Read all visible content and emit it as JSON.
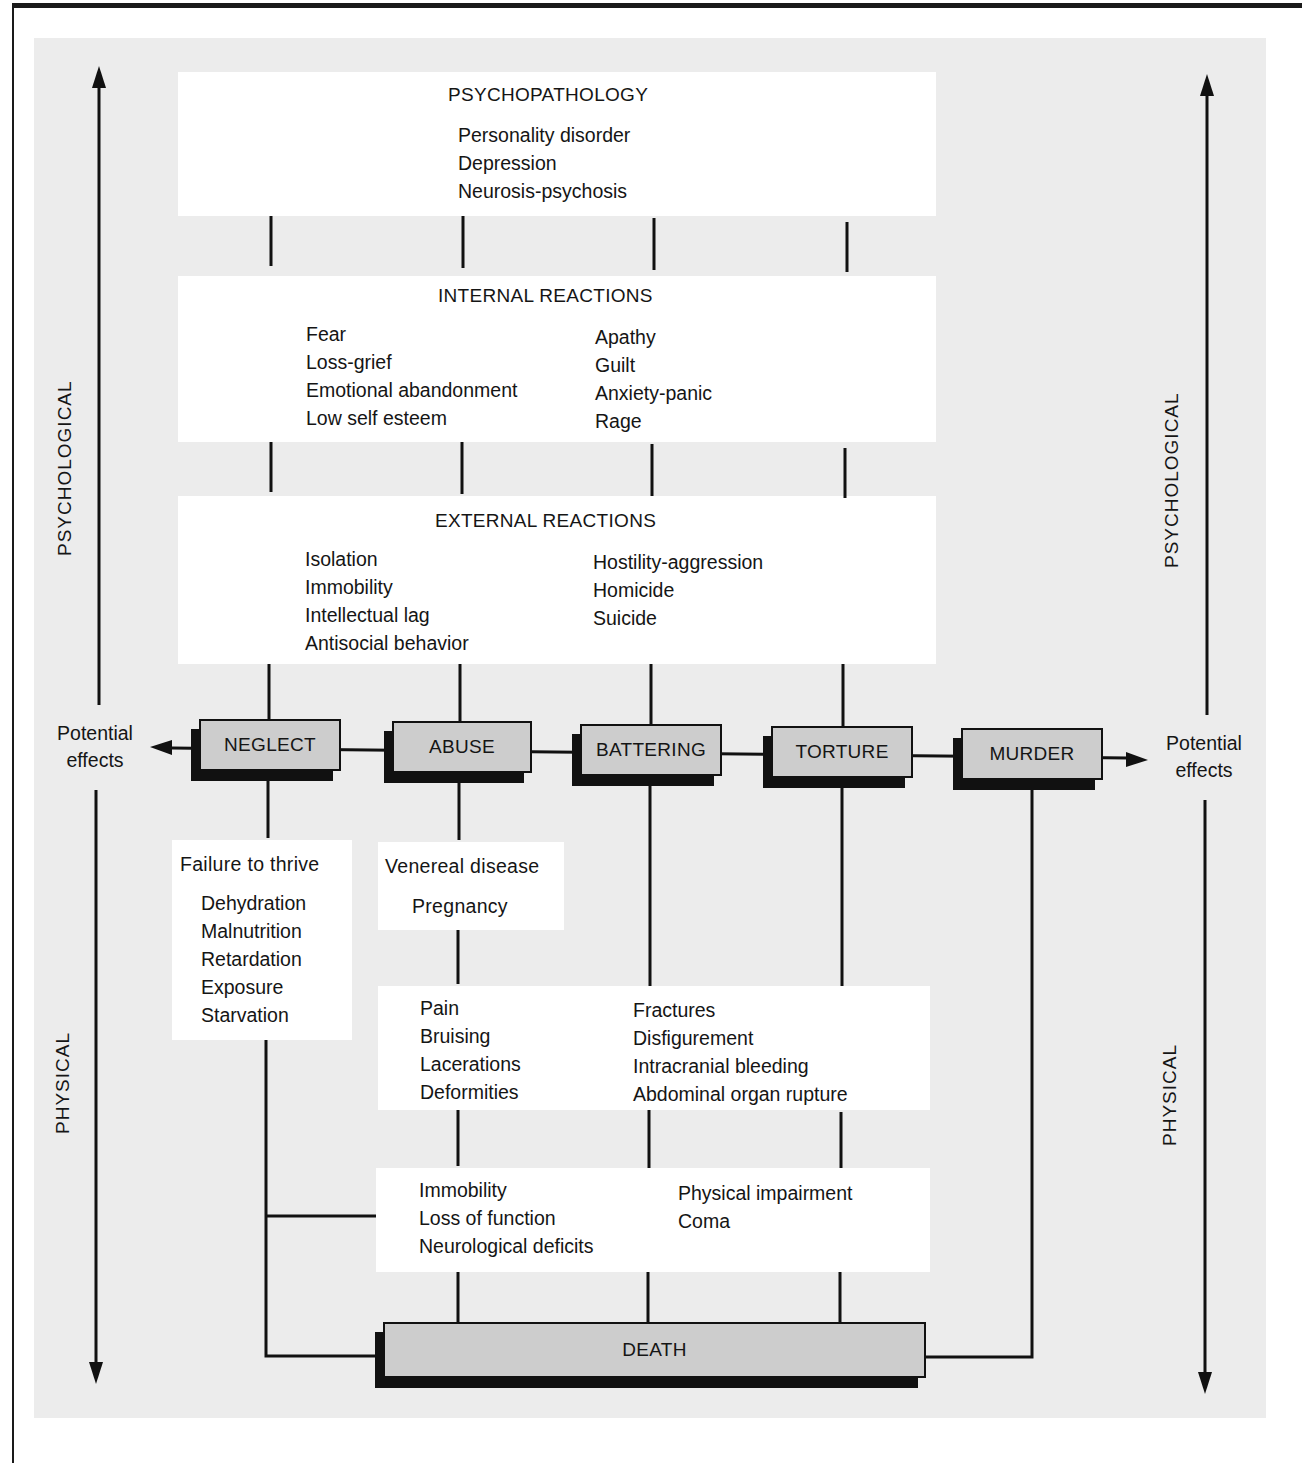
{
  "diagram": {
    "axis_labels": {
      "left_top": "PSYCHOLOGICAL",
      "left_bottom": "PHYSICAL",
      "right_top": "PSYCHOLOGICAL",
      "right_bottom": "PHYSICAL"
    },
    "potential_effects": {
      "left_line1": "Potential",
      "left_line2": "effects",
      "right_line1": "Potential",
      "right_line2": "effects"
    },
    "stages": [
      "NEGLECT",
      "ABUSE",
      "BATTERING",
      "TORTURE",
      "MURDER"
    ],
    "outcome": "DEATH",
    "psychopathology": {
      "title": "PSYCHOPATHOLOGY",
      "items": [
        "Personality disorder",
        "Depression",
        "Neurosis-psychosis"
      ]
    },
    "internal_reactions": {
      "title": "INTERNAL REACTIONS",
      "left": [
        "Fear",
        "Loss-grief",
        "Emotional abandonment",
        "Low self esteem"
      ],
      "right": [
        "Apathy",
        "Guilt",
        "Anxiety-panic",
        "Rage"
      ]
    },
    "external_reactions": {
      "title": "EXTERNAL REACTIONS",
      "left": [
        "Isolation",
        "Immobility",
        "Intellectual lag",
        "Antisocial behavior"
      ],
      "right": [
        "Hostility-aggression",
        "Homicide",
        "Suicide"
      ]
    },
    "neglect_effects": {
      "title": "Failure to thrive",
      "items": [
        "Dehydration",
        "Malnutrition",
        "Retardation",
        "Exposure",
        "Starvation"
      ]
    },
    "abuse_effects": {
      "line1": "Venereal disease",
      "line2": "Pregnancy"
    },
    "injuries": {
      "left": [
        "Pain",
        "Bruising",
        "Lacerations",
        "Deformities"
      ],
      "right": [
        "Fractures",
        "Disfigurement",
        "Intracranial bleeding",
        "Abdominal organ rupture"
      ]
    },
    "impairments": {
      "left": [
        "Immobility",
        "Loss of function",
        "Neurological deficits"
      ],
      "right": [
        "Physical impairment",
        "Coma"
      ]
    }
  }
}
